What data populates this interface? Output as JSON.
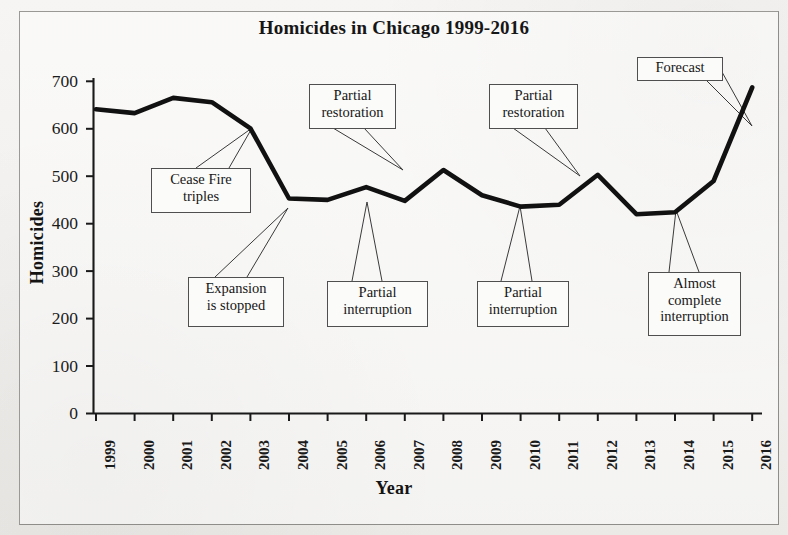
{
  "figure": {
    "title": "Homicides in Chicago 1999-2016",
    "y_axis_title": "Homicides",
    "x_axis_title": "Year"
  },
  "chart_data": {
    "type": "line",
    "title": "Homicides in Chicago 1999-2016",
    "xlabel": "Year",
    "ylabel": "Homicides",
    "xlim": [
      1999,
      2016
    ],
    "ylim": [
      0,
      700
    ],
    "ytick_labels": [
      "0",
      "100",
      "200",
      "300",
      "400",
      "500",
      "600",
      "700"
    ],
    "yticks": [
      0,
      100,
      200,
      300,
      400,
      500,
      600,
      700
    ],
    "grid": false,
    "legend": "none",
    "line_color": "#111111",
    "categories": [
      "1999",
      "2000",
      "2001",
      "2002",
      "2003",
      "2004",
      "2005",
      "2006",
      "2007",
      "2008",
      "2009",
      "2010",
      "2011",
      "2012",
      "2013",
      "2014",
      "2015",
      "2016"
    ],
    "values": [
      641,
      633,
      665,
      656,
      601,
      453,
      450,
      477,
      448,
      513,
      460,
      436,
      440,
      503,
      420,
      424,
      490,
      687
    ],
    "annotations": [
      {
        "id": "cease-fire-triples",
        "text": "Cease Fire\ntriples",
        "lines": [
          "Cease Fire",
          "triples"
        ],
        "points_to_year": "2003"
      },
      {
        "id": "expansion-is-stopped",
        "text": "Expansion\nis stopped",
        "lines": [
          "Expansion",
          "is stopped"
        ],
        "points_to_year": "2004"
      },
      {
        "id": "partial-restoration-1",
        "text": "Partial\nrestoration",
        "lines": [
          "Partial",
          "restoration"
        ],
        "points_to_year": "2008"
      },
      {
        "id": "partial-interruption-1",
        "text": "Partial\ninterruption",
        "lines": [
          "Partial",
          "interruption"
        ],
        "points_to_year": "2007"
      },
      {
        "id": "partial-restoration-2",
        "text": "Partial\nrestoration",
        "lines": [
          "Partial",
          "restoration"
        ],
        "points_to_year": "2012"
      },
      {
        "id": "partial-interruption-2",
        "text": "Partial\ninterruption",
        "lines": [
          "Partial",
          "interruption"
        ],
        "points_to_year": "2011"
      },
      {
        "id": "almost-complete-interruption",
        "text": "Almost\ncomplete\ninterruption",
        "lines": [
          "Almost",
          "complete",
          "interruption"
        ],
        "points_to_year": "2014"
      },
      {
        "id": "forecast",
        "text": "Forecast",
        "lines": [
          "Forecast"
        ],
        "points_to_year": "2016"
      }
    ]
  },
  "annotations": {
    "cease_fire": "Cease Fire\ntriples",
    "expansion_stopped": "Expansion\nis stopped",
    "partial_restoration_1": "Partial\nrestoration",
    "partial_interruption_1": "Partial\ninterruption",
    "partial_restoration_2": "Partial\nrestoration",
    "partial_interruption_2": "Partial\ninterruption",
    "almost_complete": "Almost\ncomplete\ninterruption",
    "forecast": "Forecast"
  },
  "ytick_labels": {
    "t0": "0",
    "t100": "100",
    "t200": "200",
    "t300": "300",
    "t400": "400",
    "t500": "500",
    "t600": "600",
    "t700": "700"
  },
  "xtick_labels": {
    "y1999": "1999",
    "y2000": "2000",
    "y2001": "2001",
    "y2002": "2002",
    "y2003": "2003",
    "y2004": "2004",
    "y2005": "2005",
    "y2006": "2006",
    "y2007": "2007",
    "y2008": "2008",
    "y2009": "2009",
    "y2010": "2010",
    "y2011": "2011",
    "y2012": "2012",
    "y2013": "2013",
    "y2014": "2014",
    "y2015": "2015",
    "y2016": "2016"
  }
}
